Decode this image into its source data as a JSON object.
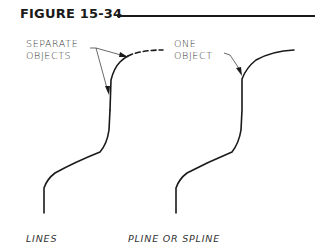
{
  "figure": {
    "title": "FIGURE 15-34"
  },
  "annotations": {
    "left_line1": "SEPARATE",
    "left_line2": "OBJECTS",
    "right_line1": "ONE",
    "right_line2": "OBJECT"
  },
  "captions": {
    "left": "LINES",
    "right": "PLINE OR SPLINE"
  },
  "colors": {
    "ink": "#1a1a1a",
    "leader": "#444444"
  }
}
